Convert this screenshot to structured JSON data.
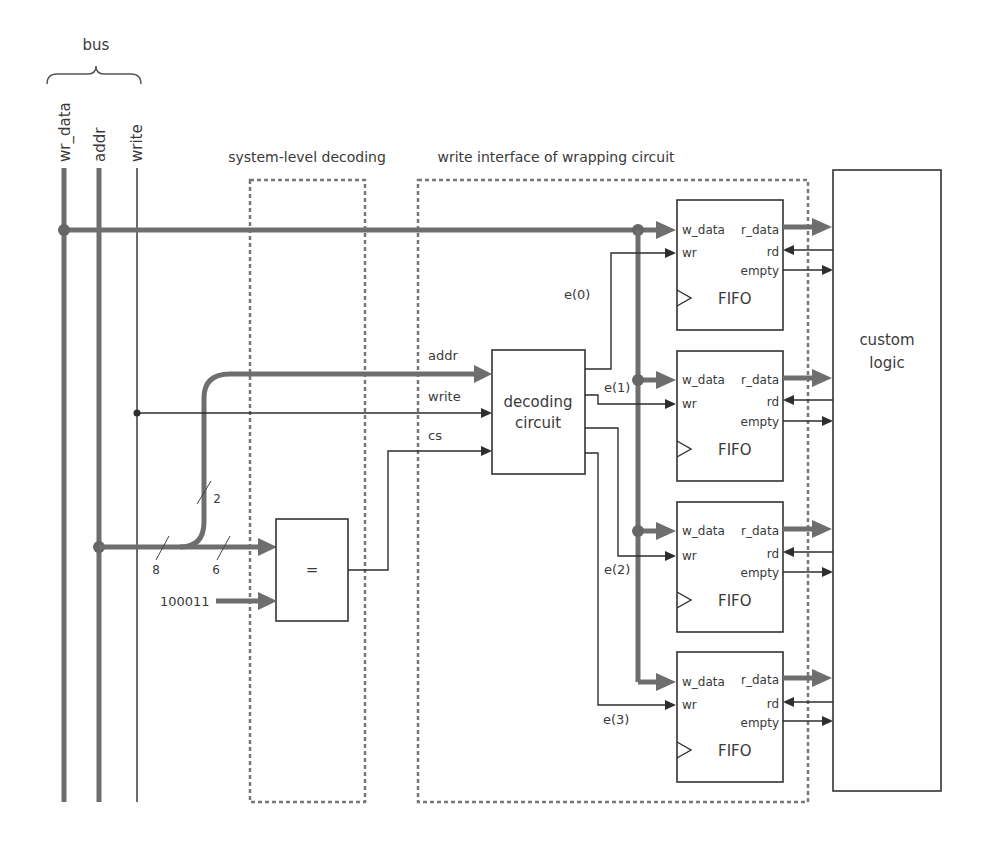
{
  "bus": {
    "label": "bus",
    "signals": [
      {
        "name": "wr_data",
        "width": "thick"
      },
      {
        "name": "addr",
        "width": "thick"
      },
      {
        "name": "write",
        "width": "thin"
      }
    ]
  },
  "regions": {
    "system_level": {
      "title": "system-level decoding"
    },
    "write_interface": {
      "title": "write interface of wrapping circuit"
    }
  },
  "comparator": {
    "symbol": "=",
    "constant_input": "100011",
    "bus_width_labels": {
      "addr_total": "8",
      "to_comparator": "6",
      "to_decoder": "2"
    }
  },
  "decoder": {
    "line1": "decoding",
    "line2": "circuit",
    "inputs": [
      "addr",
      "write",
      "cs"
    ],
    "outputs": [
      "e(0)",
      "e(1)",
      "e(2)",
      "e(3)"
    ]
  },
  "fifos": [
    {
      "name": "FIFO",
      "ports": {
        "w_data": "w_data",
        "wr": "wr",
        "r_data": "r_data",
        "rd": "rd",
        "empty": "empty"
      }
    },
    {
      "name": "FIFO",
      "ports": {
        "w_data": "w_data",
        "wr": "wr",
        "r_data": "r_data",
        "rd": "rd",
        "empty": "empty"
      }
    },
    {
      "name": "FIFO",
      "ports": {
        "w_data": "w_data",
        "wr": "wr",
        "r_data": "r_data",
        "rd": "rd",
        "empty": "empty"
      }
    },
    {
      "name": "FIFO",
      "ports": {
        "w_data": "w_data",
        "wr": "wr",
        "r_data": "r_data",
        "rd": "rd",
        "empty": "empty"
      }
    }
  ],
  "custom_logic": {
    "line1": "custom",
    "line2": "logic"
  },
  "colors": {
    "thick_bus": "#6e6e6e",
    "thin_wire": "#2e2e2e",
    "dashed_region": "#777777",
    "text": "#3a3a3a"
  }
}
